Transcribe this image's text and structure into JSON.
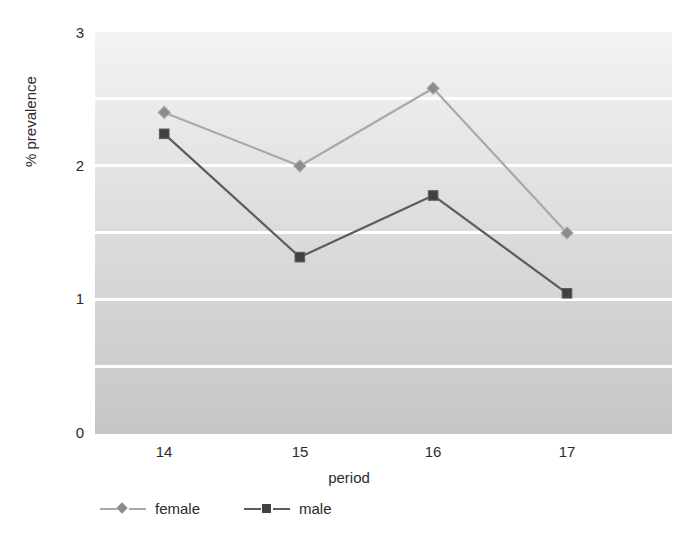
{
  "chart_data": {
    "type": "line",
    "title": "",
    "xlabel": "period",
    "ylabel": "% prevalence",
    "categories": [
      "14",
      "15",
      "16",
      "17"
    ],
    "x": [
      14,
      15,
      16,
      17
    ],
    "ylim": [
      0,
      3
    ],
    "yticks": [
      "0",
      "1",
      "2",
      "3"
    ],
    "ytick_values": [
      0,
      1,
      2,
      3
    ],
    "minor_gridlines": [
      0.5,
      1.5,
      2.5
    ],
    "grid": true,
    "grid_color": "#ffffff",
    "legend_position": "bottom-left",
    "series": [
      {
        "name": "female",
        "color": "#a7a9ab",
        "marker": "diamond",
        "marker_color": "#8a8c8e",
        "values": [
          2.4,
          2.0,
          2.58,
          1.5
        ]
      },
      {
        "name": "male",
        "color": "#5a5c5e",
        "marker": "square",
        "marker_color": "#3f4143",
        "values": [
          2.24,
          1.32,
          1.78,
          1.05
        ]
      }
    ]
  },
  "axes": {
    "x_title": "period",
    "y_title": "% prevalence"
  },
  "legend": {
    "items": [
      {
        "label": "female"
      },
      {
        "label": "male"
      }
    ]
  },
  "colors": {
    "female_line": "#a7a9ab",
    "female_marker": "#8a8c8e",
    "male_line": "#5a5c5e",
    "male_marker": "#3f4143",
    "plot_background_top": "#f2f3f4",
    "plot_background_bottom": "#c4c6c7",
    "gridline": "#ffffff",
    "text": "#2b2b2b"
  }
}
